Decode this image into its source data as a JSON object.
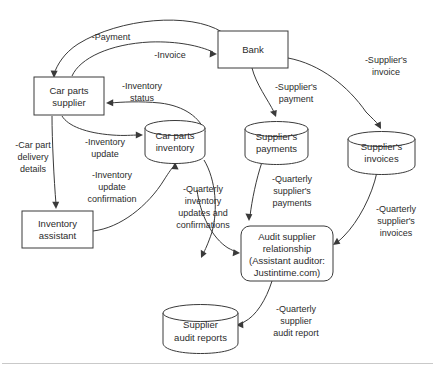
{
  "diagram": {
    "type": "data-flow-diagram",
    "title": "",
    "background_color": "#ffffff",
    "line_color": "#3a3a3a",
    "text_color": "#2b2b2b",
    "nodes": [
      {
        "id": "car-parts-supplier",
        "shape": "rectangle",
        "lines": [
          "Car parts",
          "supplier"
        ],
        "x": 34,
        "y": 77,
        "w": 70,
        "h": 38
      },
      {
        "id": "bank",
        "shape": "rectangle",
        "lines": [
          "Bank"
        ],
        "x": 218,
        "y": 31,
        "w": 70,
        "h": 37
      },
      {
        "id": "inventory-assistant",
        "shape": "rectangle",
        "lines": [
          "Inventory",
          "assistant"
        ],
        "x": 22,
        "y": 211,
        "w": 71,
        "h": 37
      },
      {
        "id": "car-parts-inventory",
        "shape": "cylinder",
        "lines": [
          "Car parts",
          "inventory"
        ],
        "x": 145,
        "y": 120,
        "w": 60,
        "h": 42
      },
      {
        "id": "suppliers-payments",
        "shape": "cylinder",
        "lines": [
          "Supplier's",
          "payments"
        ],
        "x": 245,
        "y": 121,
        "w": 63,
        "h": 42
      },
      {
        "id": "suppliers-invoices",
        "shape": "cylinder",
        "lines": [
          "Supplier's",
          "invoices"
        ],
        "x": 348,
        "y": 131,
        "w": 67,
        "h": 42
      },
      {
        "id": "supplier-audit-reports",
        "shape": "cylinder",
        "lines": [
          "Supplier",
          "audit reports"
        ],
        "x": 163,
        "y": 304,
        "w": 75,
        "h": 48
      },
      {
        "id": "audit-supplier-relationship",
        "shape": "rounded-rectangle",
        "lines": [
          "Audit supplier",
          "relationship",
          "(Assistant auditor:",
          "Justintime.com)"
        ],
        "x": 241,
        "y": 226,
        "w": 92,
        "h": 55
      }
    ],
    "edges": [
      {
        "id": "payment",
        "from": "bank",
        "to": "car-parts-supplier",
        "label": [
          "-Payment"
        ],
        "label_x": 111,
        "label_y": 40
      },
      {
        "id": "invoice",
        "from": "car-parts-supplier",
        "to": "bank",
        "label": [
          "-Invoice"
        ],
        "label_x": 170,
        "label_y": 58
      },
      {
        "id": "inventory-status",
        "from": "car-parts-inventory",
        "to": "car-parts-supplier",
        "label": [
          "-Inventory",
          "status"
        ],
        "label_x": 142,
        "label_y": 89
      },
      {
        "id": "inventory-update",
        "from": "car-parts-supplier",
        "to": "car-parts-inventory",
        "label": [
          "-Inventory",
          "update"
        ],
        "label_x": 105,
        "label_y": 142
      },
      {
        "id": "car-part-delivery-details",
        "from": "car-parts-supplier",
        "to": "inventory-assistant",
        "label": [
          "-Car part",
          "delivery",
          "details"
        ],
        "label_x": 33,
        "label_y": 148
      },
      {
        "id": "inventory-update-confirmation",
        "from": "inventory-assistant",
        "to": "car-parts-inventory",
        "label": [
          "-Inventory",
          "update",
          "confirmation"
        ],
        "label_x": 112,
        "label_y": 184
      },
      {
        "id": "suppliers-payment",
        "from": "bank",
        "to": "suppliers-payments",
        "label": [
          "-Supplier's",
          "payment"
        ],
        "label_x": 295,
        "label_y": 90
      },
      {
        "id": "suppliers-invoice",
        "from": "bank",
        "to": "suppliers-invoices",
        "label": [
          "-Supplier's",
          "invoice"
        ],
        "label_x": 386,
        "label_y": 63
      },
      {
        "id": "quarterly-inventory-updates-and-confirmations",
        "from": "car-parts-inventory",
        "to": "audit-supplier-relationship",
        "label": [
          "-Quarterly",
          "inventory",
          "updates and",
          "confirmations"
        ],
        "label_x": 203,
        "label_y": 196
      },
      {
        "id": "quarterly-suppliers-payments",
        "from": "suppliers-payments",
        "to": "audit-supplier-relationship",
        "label": [
          "-Quarterly",
          "supplier's",
          "payments"
        ],
        "label_x": 286,
        "label_y": 184
      },
      {
        "id": "quarterly-suppliers-invoices",
        "from": "suppliers-invoices",
        "to": "audit-supplier-relationship",
        "label": [
          "-Quarterly",
          "supplier's",
          "invoices"
        ],
        "label_x": 396,
        "label_y": 212
      },
      {
        "id": "quarterly-supplier-audit-report",
        "from": "audit-supplier-relationship",
        "to": "supplier-audit-reports",
        "label": [
          "-Quarterly",
          "supplier",
          "audit report"
        ],
        "label_x": 288,
        "label_y": 315
      }
    ]
  }
}
